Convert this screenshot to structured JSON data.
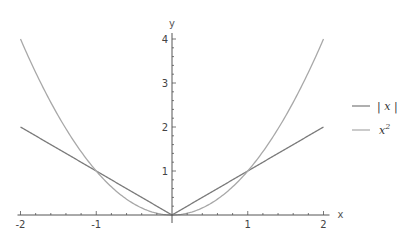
{
  "chart_data": {
    "type": "line",
    "title": "",
    "xlabel": "x",
    "ylabel": "y",
    "xlim": [
      -2,
      2
    ],
    "ylim": [
      0,
      4
    ],
    "grid": false,
    "legend_position": "right",
    "x_ticks": [
      -2,
      -1,
      1,
      2
    ],
    "x_tick_labels": [
      "-2",
      "-1",
      "1",
      "2"
    ],
    "y_ticks": [
      1,
      2,
      3,
      4
    ],
    "y_tick_labels": [
      "1",
      "2",
      "3",
      "4"
    ],
    "series": [
      {
        "name": "|x|",
        "function": "abs(x)",
        "color": "#7a7a7a",
        "x": [
          -2,
          -1.5,
          -1,
          -0.5,
          0,
          0.5,
          1,
          1.5,
          2
        ],
        "values": [
          2,
          1.5,
          1,
          0.5,
          0,
          0.5,
          1,
          1.5,
          2
        ]
      },
      {
        "name": "x²",
        "function": "x^2",
        "color": "#a8a8a8",
        "x": [
          -2,
          -1.5,
          -1,
          -0.5,
          0,
          0.5,
          1,
          1.5,
          2
        ],
        "values": [
          4,
          2.25,
          1,
          0.25,
          0,
          0.25,
          1,
          2.25,
          4
        ]
      }
    ]
  },
  "legend": {
    "items": [
      {
        "label": "| x |",
        "color": "#7a7a7a"
      },
      {
        "label": "x",
        "sup": "2",
        "color": "#a8a8a8"
      }
    ]
  },
  "axes": {
    "x_label": "x",
    "y_label": "y"
  }
}
